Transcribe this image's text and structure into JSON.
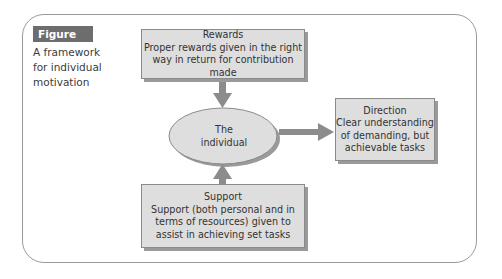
{
  "figure": {
    "label": "Figure 27.3",
    "caption": "A framework for individual motivation"
  },
  "nodes": {
    "rewards": {
      "title": "Rewards",
      "lines": [
        "Proper rewards given in the right",
        "way in return for contribution made"
      ]
    },
    "individual": {
      "lines": [
        "The",
        "individual"
      ]
    },
    "direction": {
      "title": "Direction",
      "lines": [
        "Clear understanding",
        "of demanding, but",
        "achievable tasks"
      ]
    },
    "support": {
      "title": "Support",
      "lines": [
        "Support (both personal and in",
        "terms of resources) given to",
        "assist in achieving set tasks"
      ]
    }
  },
  "edges": [
    {
      "from": "rewards",
      "to": "individual"
    },
    {
      "from": "support",
      "to": "individual"
    },
    {
      "from": "individual",
      "to": "direction"
    }
  ],
  "colors": {
    "box_fill": "#dedede",
    "box_border": "#8a8a8a",
    "shadow": "#9a9a9a",
    "arrow": "#8c8c8c",
    "label_bg": "#6d6d6d"
  }
}
